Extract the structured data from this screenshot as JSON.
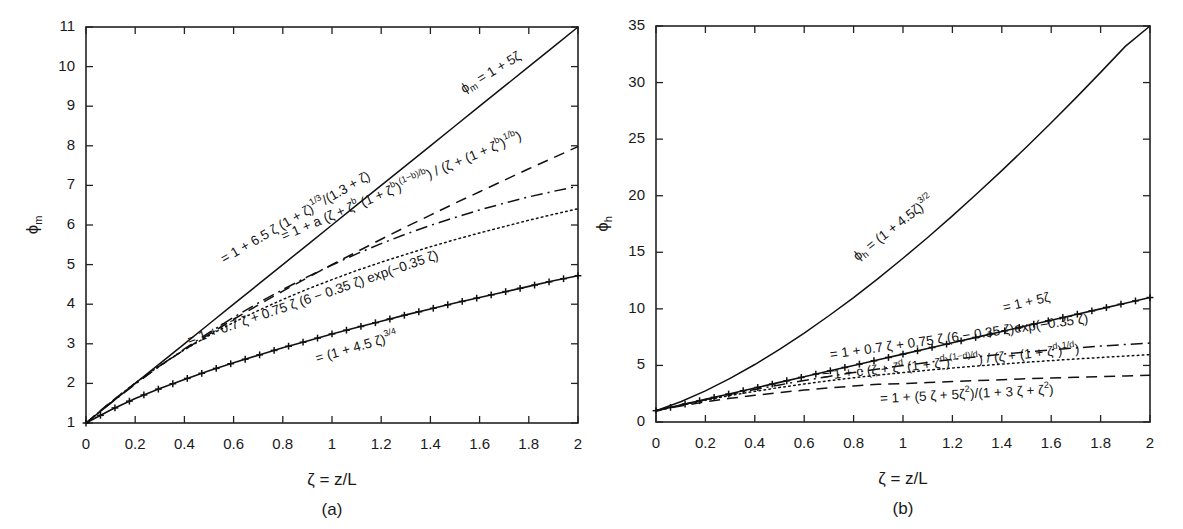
{
  "figure": {
    "background": "#ffffff",
    "ink_color": "#111111"
  },
  "panels": [
    {
      "id": "a",
      "panel_label": "(a)",
      "x_axis": {
        "label_main": "ζ = z/L",
        "min": 0,
        "max": 2,
        "ticks": [
          0,
          0.2,
          0.4,
          0.6,
          0.8,
          1,
          1.2,
          1.4,
          1.6,
          1.8,
          2
        ],
        "tick_labels": [
          "0",
          "0.2",
          "0.4",
          "0.6",
          "0.8",
          "1",
          "1.2",
          "1.4",
          "1.6",
          "1.8",
          "2"
        ]
      },
      "y_axis": {
        "label_main": "ϕ",
        "label_sub": "m",
        "min": 1,
        "max": 11,
        "ticks": [
          1,
          2,
          3,
          4,
          5,
          6,
          7,
          8,
          9,
          10,
          11
        ],
        "tick_labels": [
          "1",
          "2",
          "3",
          "4",
          "5",
          "6",
          "7",
          "8",
          "9",
          "10",
          "11"
        ]
      },
      "annotations": [
        {
          "name": "annot-phim-linear",
          "text_parts": [
            {
              "t": "ϕ",
              "k": "base"
            },
            {
              "t": "m",
              "k": "sub"
            },
            {
              "t": " = 1 + 5ζ",
              "k": "base"
            }
          ],
          "plain": "ϕm = 1 + 5ζ",
          "x": 462,
          "y": 90,
          "rotate": -31
        },
        {
          "name": "annot-businger-dyer",
          "text_parts": [
            {
              "t": "= 1 + 6.5 ζ (1 + ζ)",
              "k": "base"
            },
            {
              "t": "1/3",
              "k": "sup"
            },
            {
              "t": "/(1.3 + ζ)",
              "k": "base"
            }
          ],
          "plain": "= 1 + 6.5 ζ (1 + ζ)^1/3 /(1.3 + ζ)",
          "x": 222,
          "y": 260,
          "rotate": -30
        },
        {
          "name": "annot-general-a-b",
          "text_parts": [
            {
              "t": "= 1 + a (ζ + ζ",
              "k": "base"
            },
            {
              "t": "b",
              "k": "sup"
            },
            {
              "t": " (1 + ζ",
              "k": "base"
            },
            {
              "t": "b",
              "k": "sup"
            },
            {
              "t": ")",
              "k": "base"
            },
            {
              "t": "(1−b)/b",
              "k": "sup"
            },
            {
              "t": ") / (ζ + (1 + ζ",
              "k": "base"
            },
            {
              "t": "b",
              "k": "sup"
            },
            {
              "t": ")",
              "k": "base"
            },
            {
              "t": "1/b",
              "k": "sup"
            },
            {
              "t": ")",
              "k": "base"
            }
          ],
          "plain": "= 1 + a (ζ + ζ^b (1 + ζ^b)^(1-b)/b) / (ζ + (1 + ζ^b)^1/b)",
          "x": 282,
          "y": 237,
          "rotate": -23
        },
        {
          "name": "annot-beljaars-holtslag",
          "text_parts": [
            {
              "t": "= 1 + 0.7 ζ + 0.75 ζ (6 − 0.35 ζ) exp(−0.35 ζ)",
              "k": "base"
            }
          ],
          "plain": "= 1 + 0.7 ζ + 0.75 ζ (6 − 0.35 ζ) exp(−0.35 ζ)",
          "x": 188,
          "y": 341,
          "rotate": -19
        },
        {
          "name": "annot-cheng-brutsaert",
          "text_parts": [
            {
              "t": "= (1 + 4.5 ζ)",
              "k": "base"
            },
            {
              "t": "3/4",
              "k": "sup"
            }
          ],
          "plain": "= (1 + 4.5 ζ)^3/4",
          "x": 316,
          "y": 359,
          "rotate": -16
        }
      ],
      "chart_data": {
        "type": "line",
        "title": "",
        "xlabel": "ζ = z/L",
        "ylabel": "ϕ_m",
        "xlim": [
          0,
          2
        ],
        "ylim": [
          1,
          11
        ],
        "grid": false,
        "legend": "none (curves labelled inline)",
        "x": [
          0,
          0.1,
          0.2,
          0.3,
          0.4,
          0.5,
          0.6,
          0.7,
          0.8,
          0.9,
          1.0,
          1.1,
          1.2,
          1.3,
          1.4,
          1.5,
          1.6,
          1.7,
          1.8,
          1.9,
          2.0
        ],
        "series": [
          {
            "name": "phi_m = 1 + 5*zeta",
            "style": "solid",
            "formula": "1 + 5ζ",
            "values": [
              1.0,
              1.5,
              2.0,
              2.5,
              3.0,
              3.5,
              4.0,
              4.5,
              5.0,
              5.5,
              6.0,
              6.5,
              7.0,
              7.5,
              8.0,
              8.5,
              9.0,
              9.5,
              10.0,
              10.5,
              11.0
            ]
          },
          {
            "name": "1 + 6.5*zeta*(1+zeta)^(1/3)/(1.3+zeta)",
            "style": "dashed",
            "formula": "1 + 6.5 ζ (1 + ζ)^(1/3)/(1.3 + ζ)",
            "values": [
              1.0,
              1.53,
              2.0,
              2.44,
              2.85,
              3.24,
              3.62,
              3.98,
              4.33,
              4.67,
              5.0,
              5.32,
              5.64,
              5.95,
              6.25,
              6.55,
              6.84,
              7.13,
              7.42,
              7.7,
              7.98
            ]
          },
          {
            "name": "1 + a*(zeta + zeta^b*(1+zeta^b)^((1-b)/b))/(zeta + (1+zeta^b)^(1/b))",
            "style": "dotted",
            "formula": "1 + a (ζ + ζ^b (1 + ζ^b)^((1−b)/b)) / (ζ + (1 + ζ^b)^(1/b))",
            "values": [
              1.0,
              1.52,
              2.01,
              2.45,
              2.85,
              3.21,
              3.54,
              3.84,
              4.12,
              4.38,
              4.62,
              4.85,
              5.06,
              5.26,
              5.45,
              5.63,
              5.8,
              5.96,
              6.12,
              6.27,
              6.41
            ]
          },
          {
            "name": "1 + 0.7*zeta + 0.75*zeta*(6 - 0.35*zeta)*exp(-0.35*zeta)",
            "style": "dashdot",
            "formula": "1 + 0.7 ζ + 0.75 ζ (6 − 0.35 ζ) exp(−0.35 ζ)",
            "values": [
              1.0,
              1.5,
              1.98,
              2.44,
              2.87,
              3.28,
              3.67,
              4.03,
              4.37,
              4.69,
              4.99,
              5.27,
              5.53,
              5.77,
              5.99,
              6.19,
              6.38,
              6.55,
              6.71,
              6.85,
              6.98
            ]
          },
          {
            "name": "(1 + 4.5*zeta)^(3/4)",
            "style": "plus-markers",
            "formula": "(1 + 4.5 ζ)^(3/4)",
            "values": [
              1.0,
              1.33,
              1.62,
              1.87,
              2.1,
              2.32,
              2.52,
              2.71,
              2.9,
              3.07,
              3.25,
              3.41,
              3.57,
              3.73,
              3.88,
              4.03,
              4.17,
              4.31,
              4.45,
              4.59,
              4.72
            ]
          }
        ]
      }
    },
    {
      "id": "b",
      "panel_label": "(b)",
      "x_axis": {
        "label_main": "ζ = z/L",
        "min": 0,
        "max": 2,
        "ticks": [
          0,
          0.2,
          0.4,
          0.6,
          0.8,
          1,
          1.2,
          1.4,
          1.6,
          1.8,
          2
        ],
        "tick_labels": [
          "0",
          "0.2",
          "0.4",
          "0.6",
          "0.8",
          "1",
          "1.2",
          "1.4",
          "1.6",
          "1.8",
          "2"
        ]
      },
      "y_axis": {
        "label_main": "ϕ",
        "label_sub": "h",
        "min": 0,
        "max": 35,
        "ticks": [
          0,
          5,
          10,
          15,
          20,
          25,
          30,
          35
        ],
        "tick_labels": [
          "0",
          "5",
          "10",
          "15",
          "20",
          "25",
          "30",
          "35"
        ]
      },
      "annotations": [
        {
          "name": "annot-phih-power",
          "text_parts": [
            {
              "t": "ϕ",
              "k": "base"
            },
            {
              "t": "h",
              "k": "sub"
            },
            {
              "t": " = (1 + 4.5ζ)",
              "k": "base"
            },
            {
              "t": "3/2",
              "k": "sup"
            }
          ],
          "plain": "ϕh = (1 + 4.5ζ)^3/2",
          "x": 855,
          "y": 258,
          "rotate": -38
        },
        {
          "name": "annot-linear-5zeta",
          "text_parts": [
            {
              "t": "= 1 + 5ζ",
              "k": "base"
            }
          ],
          "plain": "= 1 + 5ζ",
          "x": 1003,
          "y": 308,
          "rotate": -13
        },
        {
          "name": "annot-beljaars-holtslag-h",
          "text_parts": [
            {
              "t": "= 1 + 0.7 ζ + 0.75 ζ (6 − 0.35 ζ)exp(−0.35 ζ)",
              "k": "base"
            }
          ],
          "plain": "= 1 + 0.7 ζ + 0.75 ζ (6 − 0.35 ζ)exp(−0.35 ζ)",
          "x": 830,
          "y": 355,
          "rotate": -8
        },
        {
          "name": "annot-general-c-d",
          "text_parts": [
            {
              "t": "= 1 + c (ζ + ζ",
              "k": "base"
            },
            {
              "t": "d",
              "k": "sup"
            },
            {
              "t": " (1 + ζ",
              "k": "base"
            },
            {
              "t": "d",
              "k": "sup"
            },
            {
              "t": ")",
              "k": "base"
            },
            {
              "t": "(1−d)/d",
              "k": "sup"
            },
            {
              "t": ") / (ζ + (1 + ζ",
              "k": "base"
            },
            {
              "t": "d",
              "k": "sup"
            },
            {
              "t": ")",
              "k": "base"
            },
            {
              "t": "1/d",
              "k": "sup"
            },
            {
              "t": ")",
              "k": "base"
            }
          ],
          "plain": "= 1 + c (ζ + ζ^d (1 + ζ^d)^((1−d)/d)) / (ζ + (1 + ζ^d)^1/d)",
          "x": 822,
          "y": 376,
          "rotate": -6
        },
        {
          "name": "annot-rational",
          "text_parts": [
            {
              "t": "= 1 + (5 ζ + 5ζ",
              "k": "base"
            },
            {
              "t": "2",
              "k": "sup"
            },
            {
              "t": ")/(1 + 3 ζ + ζ",
              "k": "base"
            },
            {
              "t": "2",
              "k": "sup"
            },
            {
              "t": ")",
              "k": "base"
            }
          ],
          "plain": "= 1 + (5 ζ + 5ζ²)/(1 + 3 ζ + ζ²)",
          "x": 880,
          "y": 399,
          "rotate": -3
        }
      ],
      "chart_data": {
        "type": "line",
        "title": "",
        "xlabel": "ζ = z/L",
        "ylabel": "ϕ_h",
        "xlim": [
          0,
          2
        ],
        "ylim": [
          0,
          35
        ],
        "grid": false,
        "legend": "none (curves labelled inline)",
        "x": [
          0,
          0.1,
          0.2,
          0.3,
          0.4,
          0.5,
          0.6,
          0.7,
          0.8,
          0.9,
          1.0,
          1.1,
          1.2,
          1.3,
          1.4,
          1.5,
          1.6,
          1.7,
          1.8,
          1.9,
          2.0
        ],
        "series": [
          {
            "name": "phi_h = (1 + 4.5*zeta)^(3/2)",
            "style": "solid",
            "formula": "(1 + 4.5 ζ)^(3/2)",
            "values": [
              1.0,
              1.79,
              2.75,
              3.85,
              5.08,
              6.42,
              7.86,
              9.39,
              11.0,
              12.7,
              14.47,
              16.31,
              18.22,
              20.19,
              22.22,
              24.31,
              26.45,
              28.65,
              30.9,
              33.2,
              35.56
            ]
          },
          {
            "name": "1 + 5*zeta",
            "style": "plus-markers",
            "formula": "1 + 5ζ",
            "values": [
              1.0,
              1.5,
              2.0,
              2.5,
              3.0,
              3.5,
              4.0,
              4.5,
              5.0,
              5.5,
              6.0,
              6.5,
              7.0,
              7.5,
              8.0,
              8.5,
              9.0,
              9.5,
              10.0,
              10.5,
              11.0
            ]
          },
          {
            "name": "1 + 0.7*zeta + 0.75*zeta*(6 - 0.35*zeta)*exp(-0.35*zeta)",
            "style": "dashdot",
            "formula": "1 + 0.7 ζ + 0.75 ζ (6 − 0.35 ζ)exp(−0.35 ζ)",
            "values": [
              1.0,
              1.5,
              1.98,
              2.44,
              2.87,
              3.28,
              3.67,
              4.03,
              4.37,
              4.69,
              4.99,
              5.27,
              5.53,
              5.77,
              5.99,
              6.19,
              6.38,
              6.55,
              6.71,
              6.85,
              6.98
            ]
          },
          {
            "name": "1 + c*(zeta + zeta^d*(1+zeta^d)^((1-d)/d))/(zeta + (1+zeta^d)^(1/d))",
            "style": "dotted",
            "formula": "1 + c (ζ + ζ^d (1 + ζ^d)^((1−d)/d)) / (ζ + (1 + ζ^d)^(1/d))",
            "values": [
              1.0,
              1.48,
              1.93,
              2.34,
              2.71,
              3.05,
              3.36,
              3.65,
              3.91,
              4.15,
              4.37,
              4.58,
              4.77,
              4.95,
              5.12,
              5.28,
              5.43,
              5.57,
              5.7,
              5.83,
              5.95
            ]
          },
          {
            "name": "1 + (5*zeta + 5*zeta^2)/(1 + 3*zeta + zeta^2)",
            "style": "dashed",
            "formula": "1 + (5 ζ + 5ζ²)/(1 + 3 ζ + ζ²)",
            "values": [
              1.0,
              1.42,
              1.78,
              2.09,
              2.36,
              2.6,
              2.82,
              3.01,
              3.18,
              3.34,
              3.4,
              3.49,
              3.58,
              3.66,
              3.74,
              3.82,
              3.89,
              3.95,
              4.01,
              4.07,
              4.13
            ]
          }
        ]
      }
    }
  ]
}
